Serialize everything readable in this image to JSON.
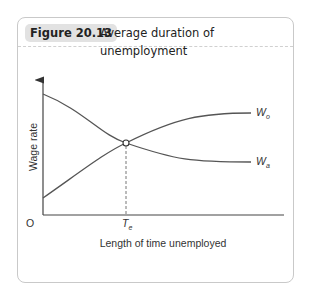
{
  "figure": {
    "label": "Figure 20.13",
    "title": "Average duration of unemployment"
  },
  "chart_data": {
    "type": "line",
    "title": "Average duration of unemployment",
    "xlabel": "Length of time unemployed",
    "ylabel": "Wage rate",
    "origin_label": "O",
    "x_tick_labels": [
      {
        "main": "T",
        "sub": "e"
      }
    ],
    "grid": false,
    "series": [
      {
        "name": "W_o",
        "label_main": "W",
        "label_sub": "o",
        "shape": "rising, concave",
        "description": "wage offers rise with time unemployed"
      },
      {
        "name": "W_a",
        "label_main": "W",
        "label_sub": "a",
        "shape": "falling, convex",
        "description": "acceptance wage falls with time unemployed"
      }
    ],
    "annotations": [
      {
        "type": "intersection",
        "of": [
          "W_o",
          "W_a"
        ],
        "x_label": "T_e",
        "marker": "open-circle",
        "dropline": "dashed"
      }
    ]
  },
  "colors": {
    "badge_bg": "#e2e2e2",
    "border": "#c9c9c9",
    "curve": "#555555"
  }
}
